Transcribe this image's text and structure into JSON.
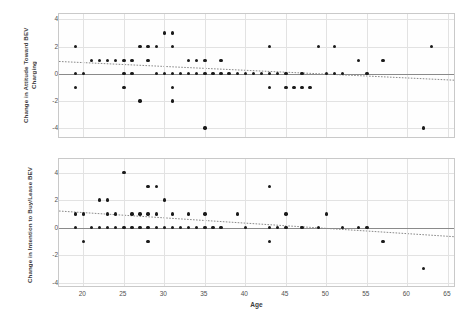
{
  "figure": {
    "width": 475,
    "height": 323,
    "background": "#ffffff",
    "dot_color": "#1a1a1a",
    "grid_color": "#e2e2e2",
    "axis_color": "#c9c9c9",
    "zero_line_color": "#8a8a8a",
    "trend_color": "#7a7a7a"
  },
  "chart_data": [
    {
      "type": "scatter",
      "id": "attitude-panel",
      "title": "",
      "xlabel": "Age",
      "ylabel": "Change in Attitude Toward BEV Charging",
      "xlim": [
        17,
        66
      ],
      "ylim": [
        -4.8,
        4.4
      ],
      "xticks": [
        20,
        25,
        30,
        35,
        40,
        45,
        50,
        55,
        60,
        65
      ],
      "yticks": [
        -4,
        -2,
        0,
        2,
        4
      ],
      "grid": true,
      "legend": "none",
      "zero_line": 0,
      "trendline": {
        "x0": 17,
        "y0": 0.85,
        "x1": 66,
        "y1": -0.55,
        "style": "dotted"
      },
      "points": [
        {
          "x": 19,
          "y": 2
        },
        {
          "x": 19,
          "y": 0
        },
        {
          "x": 19,
          "y": -1
        },
        {
          "x": 20,
          "y": 0
        },
        {
          "x": 21,
          "y": 1
        },
        {
          "x": 22,
          "y": 1
        },
        {
          "x": 23,
          "y": 1
        },
        {
          "x": 24,
          "y": 1
        },
        {
          "x": 25,
          "y": 1
        },
        {
          "x": 25,
          "y": 0
        },
        {
          "x": 25,
          "y": -1
        },
        {
          "x": 26,
          "y": 1
        },
        {
          "x": 26,
          "y": 0
        },
        {
          "x": 27,
          "y": 2
        },
        {
          "x": 27,
          "y": -2
        },
        {
          "x": 28,
          "y": 2
        },
        {
          "x": 28,
          "y": 1
        },
        {
          "x": 29,
          "y": 2
        },
        {
          "x": 29,
          "y": 0
        },
        {
          "x": 30,
          "y": 3
        },
        {
          "x": 30,
          "y": 0
        },
        {
          "x": 31,
          "y": 3
        },
        {
          "x": 31,
          "y": 2
        },
        {
          "x": 31,
          "y": 0
        },
        {
          "x": 31,
          "y": -1
        },
        {
          "x": 31,
          "y": -2
        },
        {
          "x": 32,
          "y": 0
        },
        {
          "x": 33,
          "y": 1
        },
        {
          "x": 33,
          "y": 0
        },
        {
          "x": 34,
          "y": 1
        },
        {
          "x": 34,
          "y": 0
        },
        {
          "x": 35,
          "y": 1
        },
        {
          "x": 35,
          "y": 0
        },
        {
          "x": 35,
          "y": -4
        },
        {
          "x": 36,
          "y": 0
        },
        {
          "x": 37,
          "y": 1
        },
        {
          "x": 37,
          "y": 0
        },
        {
          "x": 38,
          "y": 0
        },
        {
          "x": 39,
          "y": 0
        },
        {
          "x": 40,
          "y": 0
        },
        {
          "x": 41,
          "y": 0
        },
        {
          "x": 42,
          "y": 0
        },
        {
          "x": 43,
          "y": 2
        },
        {
          "x": 43,
          "y": 0
        },
        {
          "x": 43,
          "y": -1
        },
        {
          "x": 44,
          "y": 0
        },
        {
          "x": 45,
          "y": 0
        },
        {
          "x": 45,
          "y": -1
        },
        {
          "x": 46,
          "y": -1
        },
        {
          "x": 47,
          "y": 0
        },
        {
          "x": 47,
          "y": -1
        },
        {
          "x": 48,
          "y": -1
        },
        {
          "x": 49,
          "y": 2
        },
        {
          "x": 50,
          "y": 0
        },
        {
          "x": 51,
          "y": 2
        },
        {
          "x": 51,
          "y": 0
        },
        {
          "x": 52,
          "y": 0
        },
        {
          "x": 54,
          "y": 1
        },
        {
          "x": 55,
          "y": 0
        },
        {
          "x": 57,
          "y": 1
        },
        {
          "x": 62,
          "y": -4
        },
        {
          "x": 63,
          "y": 2
        }
      ]
    },
    {
      "type": "scatter",
      "id": "intention-panel",
      "title": "",
      "xlabel": "Age",
      "ylabel": "Change in Intention to Buy/Lease BEV",
      "xlim": [
        17,
        66
      ],
      "ylim": [
        -4.4,
        5.0
      ],
      "xticks": [
        20,
        25,
        30,
        35,
        40,
        45,
        50,
        55,
        60,
        65
      ],
      "yticks": [
        -4,
        -2,
        0,
        2,
        4
      ],
      "grid": true,
      "legend": "none",
      "zero_line": 0,
      "trendline": {
        "x0": 17,
        "y0": 1.15,
        "x1": 66,
        "y1": -0.75,
        "style": "dotted"
      },
      "points": [
        {
          "x": 19,
          "y": 1
        },
        {
          "x": 19,
          "y": 0
        },
        {
          "x": 20,
          "y": 1
        },
        {
          "x": 20,
          "y": -1
        },
        {
          "x": 21,
          "y": 0
        },
        {
          "x": 22,
          "y": 2
        },
        {
          "x": 22,
          "y": 0
        },
        {
          "x": 23,
          "y": 2
        },
        {
          "x": 23,
          "y": 1
        },
        {
          "x": 23,
          "y": 0
        },
        {
          "x": 24,
          "y": 1
        },
        {
          "x": 24,
          "y": 0
        },
        {
          "x": 25,
          "y": 4
        },
        {
          "x": 25,
          "y": 0
        },
        {
          "x": 26,
          "y": 1
        },
        {
          "x": 26,
          "y": 0
        },
        {
          "x": 27,
          "y": 1
        },
        {
          "x": 27,
          "y": 0
        },
        {
          "x": 28,
          "y": 3
        },
        {
          "x": 28,
          "y": 1
        },
        {
          "x": 28,
          "y": 0
        },
        {
          "x": 28,
          "y": -1
        },
        {
          "x": 29,
          "y": 3
        },
        {
          "x": 29,
          "y": 1
        },
        {
          "x": 29,
          "y": 0
        },
        {
          "x": 30,
          "y": 2
        },
        {
          "x": 30,
          "y": 0
        },
        {
          "x": 31,
          "y": 1
        },
        {
          "x": 31,
          "y": 0
        },
        {
          "x": 32,
          "y": 0
        },
        {
          "x": 33,
          "y": 1
        },
        {
          "x": 33,
          "y": 0
        },
        {
          "x": 34,
          "y": 0
        },
        {
          "x": 35,
          "y": 1
        },
        {
          "x": 35,
          "y": 0
        },
        {
          "x": 36,
          "y": 0
        },
        {
          "x": 37,
          "y": 0
        },
        {
          "x": 39,
          "y": 1
        },
        {
          "x": 40,
          "y": 0
        },
        {
          "x": 43,
          "y": 3
        },
        {
          "x": 43,
          "y": 0
        },
        {
          "x": 43,
          "y": -1
        },
        {
          "x": 44,
          "y": 0
        },
        {
          "x": 45,
          "y": 1
        },
        {
          "x": 45,
          "y": 0
        },
        {
          "x": 47,
          "y": 0
        },
        {
          "x": 49,
          "y": 0
        },
        {
          "x": 50,
          "y": 1
        },
        {
          "x": 52,
          "y": 0
        },
        {
          "x": 54,
          "y": 0
        },
        {
          "x": 55,
          "y": 0
        },
        {
          "x": 57,
          "y": -1
        },
        {
          "x": 62,
          "y": -3
        }
      ]
    }
  ]
}
